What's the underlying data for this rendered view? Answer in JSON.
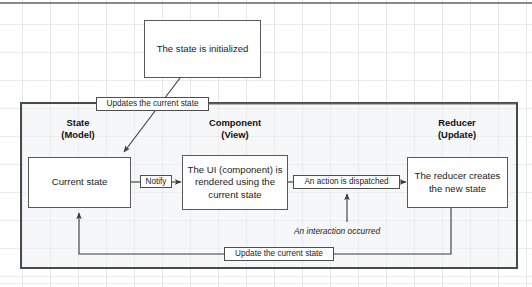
{
  "diagram": {
    "columns": [
      {
        "name": "state",
        "line1": "State",
        "line2": "(Model)"
      },
      {
        "name": "component",
        "line1": "Component",
        "line2": "(View)"
      },
      {
        "name": "reducer",
        "line1": "Reducer",
        "line2": "(Update)"
      }
    ],
    "nodes": {
      "init": "The state is initialized",
      "current_state": "Current state",
      "ui_render": "The UI (component) is rendered using the current state",
      "reducer_creates": "The reducer creates the new state"
    },
    "edge_labels": {
      "updates_current_state": "Updates the current state",
      "notify": "Notify",
      "action_dispatched": "An action is dispatched",
      "update_current_state": "Update the current state"
    },
    "annotations": {
      "interaction": "An interaction occurred"
    },
    "colors": {
      "background": "#ffffff",
      "grid_line": "#aab2be",
      "box_border": "#595959",
      "container_border": "#4a4a4a",
      "container_fill": "#eef0f2",
      "arrow": "#3a3a3a",
      "text": "#1c1c1c"
    }
  }
}
